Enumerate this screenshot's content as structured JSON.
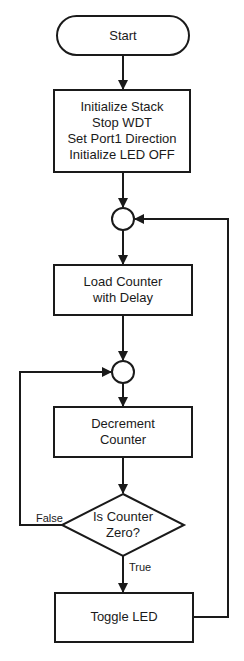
{
  "flowchart": {
    "start": {
      "label": "Start"
    },
    "init": {
      "lines": [
        "Initialize Stack",
        "Stop WDT",
        "Set Port1 Direction",
        "Initialize LED OFF"
      ]
    },
    "load": {
      "lines": [
        "Load Counter",
        "with Delay"
      ]
    },
    "decrement": {
      "lines": [
        "Decrement",
        "Counter"
      ]
    },
    "decision": {
      "lines": [
        "Is Counter",
        "Zero?"
      ],
      "false_label": "False",
      "true_label": "True"
    },
    "toggle": {
      "label": "Toggle LED"
    }
  },
  "colors": {
    "stroke": "#1a1a1a",
    "background": "#ffffff"
  }
}
